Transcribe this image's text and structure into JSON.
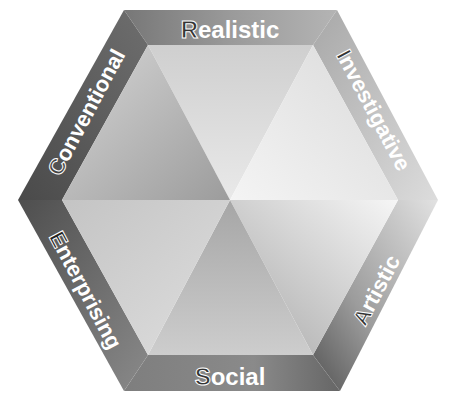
{
  "diagram": {
    "type": "hexagon",
    "title": "",
    "labels": [
      {
        "id": "realistic",
        "text": "Realistic",
        "initial": "R",
        "rest": "ealistic",
        "position": "top"
      },
      {
        "id": "investigative",
        "text": "Investigative",
        "initial": "I",
        "rest": "nvestigative",
        "position": "top-right"
      },
      {
        "id": "artistic",
        "text": "Artistic",
        "initial": "A",
        "rest": "rtistic",
        "position": "bottom-right"
      },
      {
        "id": "social",
        "text": "Social",
        "initial": "S",
        "rest": "ocial",
        "position": "bottom"
      },
      {
        "id": "enterprising",
        "text": "Enterprising",
        "initial": "E",
        "rest": "nterprising",
        "position": "bottom-left"
      },
      {
        "id": "conventional",
        "text": "Conventional",
        "initial": "C",
        "rest": "onventional",
        "position": "top-left"
      }
    ],
    "colors": {
      "background": "#ffffff",
      "band_dark": "#5e5e5e",
      "band_mid": "#8e8e8e",
      "band_light": "#d8d8d8",
      "face_light": "#f2f2f2",
      "face_mid": "#c4c4c4",
      "face_dark": "#9a9a9a",
      "label_text": "#ffffff",
      "initial_fill": "#333333"
    }
  }
}
